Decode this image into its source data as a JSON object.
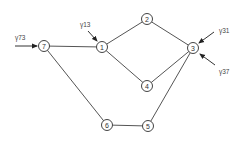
{
  "diagram": {
    "type": "directed-graph",
    "colors": {
      "edge": "#555555",
      "node_stroke": "#444444",
      "text": "#333333",
      "background": "#ffffff"
    },
    "nodes": [
      {
        "id": "7",
        "label": "7",
        "x": 44,
        "y": 46
      },
      {
        "id": "1",
        "label": "1",
        "x": 102,
        "y": 47
      },
      {
        "id": "2",
        "label": "2",
        "x": 147,
        "y": 19
      },
      {
        "id": "3",
        "label": "3",
        "x": 193,
        "y": 48
      },
      {
        "id": "4",
        "label": "4",
        "x": 147,
        "y": 86
      },
      {
        "id": "6",
        "label": "6",
        "x": 107,
        "y": 125
      },
      {
        "id": "5",
        "label": "5",
        "x": 148,
        "y": 126
      }
    ],
    "edges": [
      {
        "from": "7",
        "to": "1"
      },
      {
        "from": "1",
        "to": "2"
      },
      {
        "from": "2",
        "to": "3"
      },
      {
        "from": "1",
        "to": "4"
      },
      {
        "from": "4",
        "to": "3"
      },
      {
        "from": "7",
        "to": "6"
      },
      {
        "from": "6",
        "to": "5"
      },
      {
        "from": "5",
        "to": "3"
      }
    ],
    "inputs": [
      {
        "label": "γ73",
        "target": "7",
        "x1": 15,
        "y1": 46,
        "x2": 37,
        "y2": 46,
        "label_x": 15,
        "label_y": 40
      },
      {
        "label": "γ13",
        "target": "1",
        "x1": 88,
        "y1": 31,
        "x2": 97,
        "y2": 41,
        "label_x": 80,
        "label_y": 27
      },
      {
        "label": "γ31",
        "target": "3",
        "x1": 214,
        "y1": 32,
        "x2": 199,
        "y2": 43,
        "label_x": 219,
        "label_y": 33
      },
      {
        "label": "γ37",
        "target": "3",
        "x1": 215,
        "y1": 65,
        "x2": 200,
        "y2": 54,
        "label_x": 219,
        "label_y": 74
      }
    ]
  }
}
